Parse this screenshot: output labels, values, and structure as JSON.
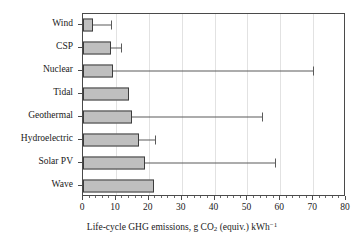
{
  "chart_data": {
    "type": "bar",
    "orientation": "horizontal",
    "title": "",
    "xlabel": "Life-cycle GHG emissions, g CO2 (equiv.) kWh-1",
    "xlabel_parts": {
      "lead": "Life-cycle GHG emissions, g CO",
      "sub": "2",
      "mid": " (equiv.) kWh",
      "sup": "−1"
    },
    "ylabel": "",
    "categories": [
      "Wind",
      "CSP",
      "Nuclear",
      "Tidal",
      "Geothermal",
      "Hydroelectric",
      "Solar PV",
      "Wave"
    ],
    "values": [
      3,
      8.5,
      9,
      14,
      15,
      17,
      19,
      21.5
    ],
    "error_high": [
      8.5,
      11.5,
      70,
      null,
      54.5,
      22,
      58.5,
      null
    ],
    "xlim": [
      0,
      80
    ],
    "xticks": [
      0,
      10,
      20,
      30,
      40,
      50,
      60,
      70,
      80
    ],
    "xtick_labels": [
      "0",
      "10",
      "20",
      "30",
      "40",
      "50",
      "60",
      "70",
      "80"
    ],
    "xminor_step": 2,
    "grid": "vertical-major",
    "legend": "none",
    "bar_fill": "#bfbfbf",
    "bar_edge": "#3d3d3d",
    "axis_color": "#4a4a4a",
    "grid_color": "#e2e2e2"
  }
}
